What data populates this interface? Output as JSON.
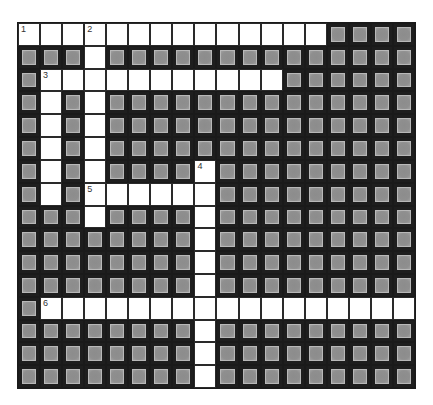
{
  "puzzle": {
    "type": "crossword",
    "cols": 18,
    "rows": 16,
    "colors": {
      "block": "#8c8c8c",
      "cell": "#ffffff",
      "line": "#1a1a1a"
    },
    "words": [
      {
        "number": "1",
        "direction": "across",
        "row": 0,
        "col": 0,
        "length": 14
      },
      {
        "number": "2",
        "direction": "down",
        "row": 0,
        "col": 3,
        "length": 9
      },
      {
        "number": "3",
        "direction": "across",
        "row": 2,
        "col": 1,
        "length": 11
      },
      {
        "number": "3",
        "direction": "down",
        "row": 2,
        "col": 1,
        "length": 6
      },
      {
        "number": "4",
        "direction": "down",
        "row": 6,
        "col": 8,
        "length": 10
      },
      {
        "number": "5",
        "direction": "across",
        "row": 7,
        "col": 3,
        "length": 6
      },
      {
        "number": "6",
        "direction": "across",
        "row": 12,
        "col": 1,
        "length": 17
      }
    ],
    "numbers": [
      {
        "label": "1",
        "row": 0,
        "col": 0
      },
      {
        "label": "2",
        "row": 0,
        "col": 3
      },
      {
        "label": "3",
        "row": 2,
        "col": 1
      },
      {
        "label": "4",
        "row": 6,
        "col": 8
      },
      {
        "label": "5",
        "row": 7,
        "col": 3
      },
      {
        "label": "6",
        "row": 12,
        "col": 1
      }
    ]
  }
}
